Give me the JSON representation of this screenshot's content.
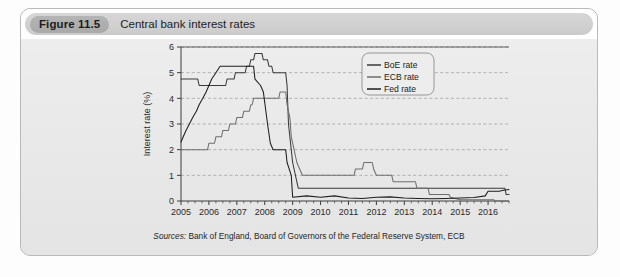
{
  "figure": {
    "number_label": "Figure 11.5",
    "title": "Central bank interest rates",
    "source_prefix": "Sources:",
    "source_text": " Bank of England, Board of Governors of the Federal Reserve System, ECB"
  },
  "colors": {
    "card_border": "#b9b9b9",
    "card_body": "#e9e9e9",
    "pill": "#b0b0b0",
    "boe": "#3a3a3a",
    "ecb": "#6e6e6e",
    "fed": "#1e1e1e",
    "grid": "#9a9a9a",
    "axis": "#3c3c3c"
  },
  "chart_data": {
    "type": "line",
    "title": "Central bank interest rates",
    "xlabel": "",
    "ylabel": "Interest rate (%)",
    "ylim": [
      0,
      6
    ],
    "xlim": [
      2005,
      2016.75
    ],
    "yticks": [
      0,
      1,
      2,
      3,
      4,
      5,
      6
    ],
    "xticks": [
      2005,
      2006,
      2007,
      2008,
      2009,
      2010,
      2011,
      2012,
      2013,
      2014,
      2015,
      2016
    ],
    "xtick_labels": [
      "2005",
      "2006",
      "2007",
      "2008",
      "2009",
      "2010",
      "2011",
      "2012",
      "2013",
      "2014",
      "2015",
      "2016"
    ],
    "ytick_labels": [
      "0",
      "1",
      "2",
      "3",
      "4",
      "5",
      "6"
    ],
    "grid": "horizontal-dashed",
    "legend_position": "top-center",
    "legend": [
      "BoE rate",
      "ECB rate",
      "Fed rate"
    ],
    "series": [
      {
        "name": "BoE rate",
        "color": "#3a3a3a",
        "points": [
          [
            2005.0,
            4.75
          ],
          [
            2005.6,
            4.75
          ],
          [
            2005.65,
            4.5
          ],
          [
            2006.6,
            4.5
          ],
          [
            2006.65,
            4.75
          ],
          [
            2006.9,
            4.75
          ],
          [
            2006.95,
            5.0
          ],
          [
            2007.3,
            5.0
          ],
          [
            2007.35,
            5.25
          ],
          [
            2007.45,
            5.25
          ],
          [
            2007.5,
            5.5
          ],
          [
            2007.6,
            5.5
          ],
          [
            2007.65,
            5.75
          ],
          [
            2007.9,
            5.75
          ],
          [
            2007.95,
            5.5
          ],
          [
            2008.1,
            5.5
          ],
          [
            2008.15,
            5.25
          ],
          [
            2008.25,
            5.25
          ],
          [
            2008.3,
            5.0
          ],
          [
            2008.75,
            5.0
          ],
          [
            2008.8,
            4.5
          ],
          [
            2008.85,
            3.0
          ],
          [
            2008.95,
            2.0
          ],
          [
            2009.0,
            1.5
          ],
          [
            2009.1,
            1.0
          ],
          [
            2009.2,
            0.5
          ],
          [
            2016.6,
            0.5
          ],
          [
            2016.65,
            0.25
          ],
          [
            2016.75,
            0.25
          ]
        ]
      },
      {
        "name": "ECB rate",
        "color": "#6e6e6e",
        "points": [
          [
            2005.0,
            2.0
          ],
          [
            2005.95,
            2.0
          ],
          [
            2006.0,
            2.25
          ],
          [
            2006.2,
            2.25
          ],
          [
            2006.25,
            2.5
          ],
          [
            2006.45,
            2.5
          ],
          [
            2006.5,
            2.75
          ],
          [
            2006.7,
            2.75
          ],
          [
            2006.75,
            3.0
          ],
          [
            2006.95,
            3.0
          ],
          [
            2007.0,
            3.25
          ],
          [
            2007.2,
            3.25
          ],
          [
            2007.25,
            3.5
          ],
          [
            2007.45,
            3.5
          ],
          [
            2007.5,
            3.75
          ],
          [
            2007.55,
            3.75
          ],
          [
            2007.6,
            4.0
          ],
          [
            2008.5,
            4.0
          ],
          [
            2008.55,
            4.25
          ],
          [
            2008.75,
            4.25
          ],
          [
            2008.8,
            3.75
          ],
          [
            2008.9,
            3.25
          ],
          [
            2008.95,
            2.5
          ],
          [
            2009.05,
            2.0
          ],
          [
            2009.15,
            1.5
          ],
          [
            2009.25,
            1.25
          ],
          [
            2009.35,
            1.0
          ],
          [
            2011.2,
            1.0
          ],
          [
            2011.25,
            1.25
          ],
          [
            2011.5,
            1.25
          ],
          [
            2011.55,
            1.5
          ],
          [
            2011.85,
            1.5
          ],
          [
            2011.9,
            1.25
          ],
          [
            2012.0,
            1.0
          ],
          [
            2012.55,
            1.0
          ],
          [
            2012.6,
            0.75
          ],
          [
            2013.4,
            0.75
          ],
          [
            2013.45,
            0.5
          ],
          [
            2013.85,
            0.5
          ],
          [
            2013.9,
            0.25
          ],
          [
            2014.6,
            0.25
          ],
          [
            2014.65,
            0.15
          ],
          [
            2015.0,
            0.05
          ],
          [
            2016.2,
            0.05
          ],
          [
            2016.25,
            0.0
          ],
          [
            2016.75,
            0.0
          ]
        ]
      },
      {
        "name": "Fed rate",
        "color": "#1e1e1e",
        "points": [
          [
            2005.0,
            2.3
          ],
          [
            2005.08,
            2.5
          ],
          [
            2005.18,
            2.75
          ],
          [
            2005.3,
            3.0
          ],
          [
            2005.42,
            3.25
          ],
          [
            2005.55,
            3.5
          ],
          [
            2005.65,
            3.75
          ],
          [
            2005.78,
            4.0
          ],
          [
            2005.9,
            4.25
          ],
          [
            2006.0,
            4.5
          ],
          [
            2006.1,
            4.75
          ],
          [
            2006.25,
            5.0
          ],
          [
            2006.4,
            5.25
          ],
          [
            2007.6,
            5.25
          ],
          [
            2007.65,
            4.75
          ],
          [
            2007.85,
            4.5
          ],
          [
            2007.95,
            4.25
          ],
          [
            2008.1,
            3.0
          ],
          [
            2008.2,
            2.25
          ],
          [
            2008.3,
            2.0
          ],
          [
            2008.75,
            2.0
          ],
          [
            2008.8,
            1.5
          ],
          [
            2008.95,
            1.0
          ],
          [
            2009.0,
            0.15
          ],
          [
            2009.5,
            0.2
          ],
          [
            2010.0,
            0.15
          ],
          [
            2010.5,
            0.2
          ],
          [
            2011.0,
            0.12
          ],
          [
            2011.5,
            0.1
          ],
          [
            2012.0,
            0.15
          ],
          [
            2012.5,
            0.16
          ],
          [
            2013.0,
            0.12
          ],
          [
            2013.5,
            0.1
          ],
          [
            2014.0,
            0.09
          ],
          [
            2014.5,
            0.1
          ],
          [
            2015.0,
            0.12
          ],
          [
            2015.5,
            0.14
          ],
          [
            2015.9,
            0.2
          ],
          [
            2016.0,
            0.38
          ],
          [
            2016.4,
            0.38
          ],
          [
            2016.55,
            0.42
          ],
          [
            2016.75,
            0.45
          ]
        ]
      }
    ]
  }
}
